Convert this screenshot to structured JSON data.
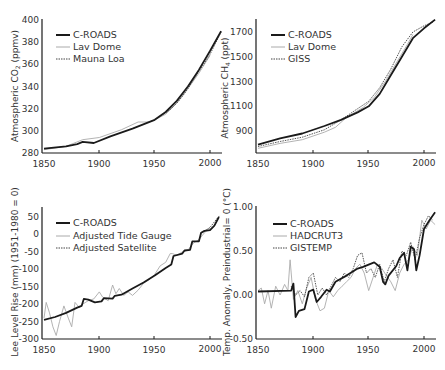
{
  "chart_data": [
    {
      "id": "co2",
      "type": "line",
      "title": "",
      "xlabel": "",
      "ylabel": "Atmospheric CO2 (ppmv)",
      "xlim": [
        1850,
        2010
      ],
      "ylim": [
        280,
        400
      ],
      "xticks": [
        1850,
        1900,
        1950,
        2000
      ],
      "yticks": [
        280,
        300,
        320,
        340,
        360,
        380,
        400
      ],
      "grid": false,
      "legend_position": "upper-left",
      "series": [
        {
          "name": "C-ROADS",
          "style": "solid-thick",
          "color": "#1a1a1a",
          "x": [
            1850,
            1870,
            1880,
            1885,
            1895,
            1910,
            1930,
            1950,
            1960,
            1970,
            1980,
            1990,
            2000,
            2010
          ],
          "y": [
            284,
            286,
            288,
            290,
            289,
            295,
            302,
            310,
            317,
            327,
            340,
            355,
            372,
            390
          ]
        },
        {
          "name": "Lav Dome",
          "style": "solid-thin",
          "color": "#aaaaaa",
          "x": [
            1850,
            1870,
            1885,
            1900,
            1920,
            1935,
            1945,
            1950,
            1960,
            1970,
            1980,
            1990,
            2000
          ],
          "y": [
            283,
            286,
            292,
            294,
            301,
            308,
            308,
            310,
            315,
            325,
            338,
            352,
            368
          ]
        },
        {
          "name": "Mauna Loa",
          "style": "dotted",
          "color": "#444444",
          "x": [
            1958,
            1965,
            1970,
            1975,
            1980,
            1985,
            1990,
            1995,
            2000,
            2005,
            2010
          ],
          "y": [
            315,
            320,
            325,
            331,
            338,
            346,
            354,
            361,
            369,
            379,
            389
          ]
        }
      ]
    },
    {
      "id": "ch4",
      "type": "line",
      "title": "",
      "xlabel": "",
      "ylabel": "Atmospheric CH4 (ppt)",
      "xlim": [
        1850,
        2010
      ],
      "ylim": [
        720,
        1800
      ],
      "xticks": [
        1850,
        1900,
        1950,
        2000
      ],
      "yticks": [
        900,
        1100,
        1300,
        1500,
        1700
      ],
      "grid": false,
      "legend_position": "upper-left",
      "series": [
        {
          "name": "C-ROADS",
          "style": "solid-thick",
          "color": "#1a1a1a",
          "x": [
            1850,
            1870,
            1890,
            1910,
            1925,
            1940,
            1950,
            1960,
            1970,
            1980,
            1990,
            2000,
            2010
          ],
          "y": [
            790,
            840,
            880,
            940,
            990,
            1050,
            1100,
            1200,
            1350,
            1500,
            1650,
            1730,
            1800
          ]
        },
        {
          "name": "Lav Dome",
          "style": "solid-thin",
          "color": "#aaaaaa",
          "x": [
            1850,
            1870,
            1890,
            1910,
            1920,
            1930,
            1945,
            1955,
            1965,
            1975,
            1985,
            1990
          ],
          "y": [
            760,
            800,
            830,
            890,
            930,
            1010,
            1090,
            1170,
            1300,
            1450,
            1600,
            1680
          ]
        },
        {
          "name": "GISS",
          "style": "dotted",
          "color": "#444444",
          "x": [
            1850,
            1870,
            1890,
            1910,
            1925,
            1940,
            1950,
            1960,
            1970,
            1980,
            1990,
            2000,
            2008
          ],
          "y": [
            775,
            815,
            850,
            910,
            990,
            1080,
            1140,
            1250,
            1400,
            1580,
            1700,
            1750,
            1780
          ]
        }
      ]
    },
    {
      "id": "sea-level",
      "type": "line",
      "title": "",
      "xlabel": "",
      "ylabel": "Lee Level Rise (mm) (1951-1980 = 0)",
      "xlim": [
        1850,
        2010
      ],
      "ylim": [
        -300,
        60
      ],
      "xticks": [
        1850,
        1900,
        1950,
        2000
      ],
      "yticks": [
        -300,
        -250,
        -200,
        -150,
        -100,
        -50,
        0,
        50
      ],
      "grid": false,
      "legend_position": "upper-left",
      "series": [
        {
          "name": "C-ROADS",
          "style": "solid-thick",
          "color": "#1a1a1a",
          "x": [
            1850,
            1860,
            1870,
            1880,
            1884,
            1886,
            1890,
            1896,
            1902,
            1904,
            1912,
            1914,
            1920,
            1930,
            1940,
            1950,
            1960,
            1965,
            1967,
            1975,
            1977,
            1982,
            1984,
            1990,
            1992,
            1995,
            2000,
            2004,
            2008
          ],
          "y": [
            -245,
            -237,
            -225,
            -210,
            -205,
            -185,
            -187,
            -195,
            -192,
            -183,
            -184,
            -176,
            -173,
            -155,
            -138,
            -118,
            -96,
            -86,
            -62,
            -55,
            -46,
            -44,
            -20,
            -20,
            5,
            10,
            12,
            25,
            50
          ]
        },
        {
          "name": "Adjusted Tide Gauge",
          "style": "solid-thin",
          "color": "#aaaaaa",
          "x": [
            1850,
            1852,
            1855,
            1858,
            1861,
            1864,
            1868,
            1872,
            1875,
            1878,
            1882,
            1885,
            1890,
            1895,
            1900,
            1903,
            1908,
            1912,
            1915,
            1918,
            1922,
            1926,
            1930,
            1935,
            1940,
            1945,
            1950,
            1955,
            1960,
            1964,
            1966,
            1970,
            1975,
            1980,
            1985,
            1990,
            1995,
            2000
          ],
          "y": [
            -240,
            -195,
            -225,
            -265,
            -290,
            -250,
            -205,
            -240,
            -265,
            -195,
            -210,
            -200,
            -190,
            -185,
            -165,
            -180,
            -190,
            -145,
            -170,
            -155,
            -175,
            -165,
            -175,
            -160,
            -140,
            -130,
            -115,
            -90,
            -80,
            -55,
            -55,
            -60,
            -50,
            -45,
            -25,
            -15,
            5,
            20
          ]
        },
        {
          "name": "Adjusted Satellite",
          "style": "dotted",
          "color": "#444444",
          "x": [
            1993,
            1996,
            2000,
            2003,
            2006,
            2009
          ],
          "y": [
            5,
            12,
            20,
            32,
            44,
            55
          ]
        }
      ]
    },
    {
      "id": "temperature",
      "type": "line",
      "title": "",
      "xlabel": "",
      "ylabel": "Temp. Anomaly, Preindustrial= 0 (°C)",
      "xlim": [
        1850,
        2010
      ],
      "ylim": [
        -0.5,
        1.0
      ],
      "xticks": [
        1850,
        1900,
        1950,
        2000
      ],
      "yticks": [
        -0.5,
        0.0,
        0.5,
        1.0
      ],
      "ytick_labels": [
        "-0.50",
        "0.00",
        "0.50",
        "1.00"
      ],
      "grid": false,
      "legend_position": "upper-left",
      "series": [
        {
          "name": "C-ROADS",
          "style": "solid-thick",
          "color": "#1a1a1a",
          "x": [
            1850,
            1880,
            1882,
            1884,
            1887,
            1892,
            1896,
            1900,
            1903,
            1907,
            1912,
            1915,
            1920,
            1930,
            1940,
            1945,
            1955,
            1960,
            1963,
            1965,
            1968,
            1975,
            1978,
            1982,
            1985,
            1988,
            1991,
            1993,
            1996,
            2000,
            2005,
            2010
          ],
          "y": [
            0.04,
            0.05,
            0.13,
            -0.25,
            -0.18,
            -0.16,
            0.04,
            0.06,
            -0.08,
            -0.02,
            0.06,
            0.04,
            0.15,
            0.22,
            0.3,
            0.32,
            0.37,
            0.32,
            0.15,
            0.12,
            0.22,
            0.33,
            0.42,
            0.48,
            0.28,
            0.55,
            0.52,
            0.28,
            0.45,
            0.75,
            0.85,
            0.94
          ]
        },
        {
          "name": "HADCRUT3",
          "style": "solid-thin",
          "color": "#aaaaaa",
          "x": [
            1850,
            1853,
            1856,
            1859,
            1862,
            1866,
            1870,
            1874,
            1877,
            1879,
            1882,
            1886,
            1890,
            1894,
            1898,
            1902,
            1906,
            1910,
            1914,
            1918,
            1922,
            1926,
            1930,
            1934,
            1938,
            1942,
            1946,
            1950,
            1954,
            1958,
            1962,
            1966,
            1970,
            1974,
            1978,
            1982,
            1986,
            1990,
            1994,
            1998,
            2002,
            2006,
            2010
          ],
          "y": [
            0.05,
            0.08,
            -0.1,
            0.05,
            -0.15,
            0.1,
            0.0,
            0.12,
            0.05,
            0.4,
            -0.05,
            0.05,
            -0.1,
            0.08,
            0.2,
            -0.05,
            -0.18,
            -0.15,
            0.05,
            -0.02,
            0.05,
            0.1,
            0.15,
            0.2,
            0.3,
            0.35,
            0.25,
            0.05,
            0.2,
            0.35,
            0.3,
            0.22,
            0.15,
            0.05,
            0.25,
            0.35,
            0.4,
            0.55,
            0.45,
            0.85,
            0.75,
            0.85,
            0.8
          ]
        },
        {
          "name": "GISTEMP",
          "style": "dotted",
          "color": "#444444",
          "x": [
            1880,
            1884,
            1888,
            1892,
            1896,
            1900,
            1904,
            1908,
            1912,
            1916,
            1920,
            1924,
            1928,
            1932,
            1936,
            1940,
            1944,
            1948,
            1952,
            1956,
            1960,
            1964,
            1968,
            1972,
            1976,
            1980,
            1984,
            1988,
            1992,
            1996,
            2000,
            2004,
            2008
          ],
          "y": [
            0.1,
            0.0,
            0.05,
            -0.02,
            0.2,
            0.25,
            0.0,
            0.08,
            0.0,
            0.1,
            0.2,
            0.15,
            0.25,
            0.2,
            0.3,
            0.45,
            0.48,
            0.25,
            0.3,
            0.2,
            0.35,
            0.15,
            0.3,
            0.4,
            0.2,
            0.5,
            0.45,
            0.6,
            0.4,
            0.65,
            0.8,
            0.9,
            0.85
          ]
        }
      ]
    }
  ],
  "panels": {
    "co2": {
      "ylabel_main": "Atmospheric CO",
      "ylabel_sub": "2",
      "ylabel_tail": " (ppmv)",
      "legend": [
        "C-ROADS",
        "Lav Dome",
        "Mauna Loa"
      ],
      "xtick_labels": [
        "1850",
        "1900",
        "1950",
        "2000"
      ],
      "ytick_labels": [
        "280",
        "300",
        "320",
        "340",
        "360",
        "380",
        "400"
      ]
    },
    "ch4": {
      "ylabel_main": "Atmospheric CH",
      "ylabel_sub": "4",
      "ylabel_tail": " (ppt)",
      "legend": [
        "C-ROADS",
        "Lav Dome",
        "GISS"
      ],
      "xtick_labels": [
        "1850",
        "1900",
        "1950",
        "2000"
      ],
      "ytick_labels": [
        "900",
        "1100",
        "1300",
        "1500",
        "1700"
      ]
    },
    "sea": {
      "ylabel": "Lee Level Rise (mm) (1951-1980 = 0)",
      "legend": [
        "C-ROADS",
        "Adjusted Tide Gauge",
        "Adjusted Satellite"
      ],
      "xtick_labels": [
        "1850",
        "1900",
        "1950",
        "2000"
      ],
      "ytick_labels": [
        "-300",
        "-250",
        "-200",
        "-150",
        "-100",
        "-50",
        "0",
        "50"
      ]
    },
    "temp": {
      "ylabel": "Temp. Anomaly, Preindustrial= 0 (°C)",
      "legend": [
        "C-ROADS",
        "HADCRUT3",
        "GISTEMP"
      ],
      "xtick_labels": [
        "1850",
        "1900",
        "1950",
        "2000"
      ],
      "ytick_labels": [
        "-0.50",
        "0.00",
        "0.50",
        "1.00"
      ]
    }
  },
  "colors": {
    "axis": "#1a1a1a",
    "model": "#1a1a1a",
    "observed_thin": "#aaaaaa",
    "observed_dotted": "#444444",
    "text": "#333333"
  }
}
